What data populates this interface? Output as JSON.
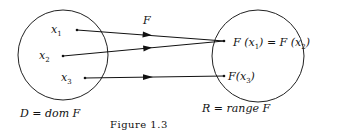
{
  "figure": {
    "caption": "Figure 1.3",
    "mapping_label": "F",
    "domain": {
      "label": "D = dom F",
      "points": [
        {
          "name": "x",
          "sub": "1"
        },
        {
          "name": "x",
          "sub": "2"
        },
        {
          "name": "x",
          "sub": "3"
        }
      ]
    },
    "range": {
      "label": "R = range F",
      "points": [
        {
          "text": "F (x",
          "sub": "1",
          "mid": ") = F (x",
          "sub2": "2",
          "end": ")"
        },
        {
          "text": "F(x",
          "sub": "3",
          "end": ")"
        }
      ]
    },
    "arrows": [
      {
        "from": "x1",
        "to": "F(x1) = F(x2)"
      },
      {
        "from": "x2",
        "to": "F(x1) = F(x2)"
      },
      {
        "from": "x3",
        "to": "F(x3)"
      }
    ]
  }
}
